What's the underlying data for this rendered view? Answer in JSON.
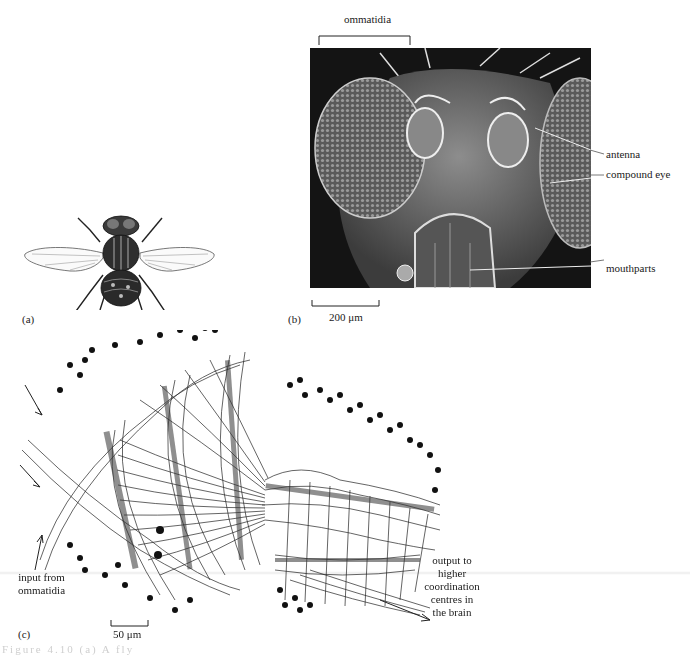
{
  "figure": {
    "panels": [
      {
        "id": "a",
        "letter": "(a)",
        "subject": "line drawing of a housefly, dorsal view"
      },
      {
        "id": "b",
        "letter": "(b)",
        "subject": "scanning electron micrograph of fly head",
        "top_label": "ommatidia",
        "labels": [
          "antenna",
          "compound eye",
          "mouthparts"
        ],
        "scale_bar": "200 μm"
      },
      {
        "id": "c",
        "letter": "(c)",
        "subject": "neuron drawing of optic lobe",
        "input_label": [
          "input from",
          "ommatidia"
        ],
        "output_label": [
          "output to",
          "higher",
          "coordination",
          "centres in",
          "the brain"
        ],
        "scale_bar": "50 μm"
      }
    ],
    "caption_partial": "Figure 4.10  (a) A fly"
  }
}
